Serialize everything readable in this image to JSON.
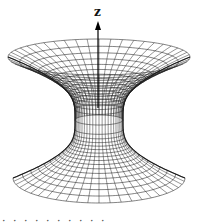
{
  "figure": {
    "type": "embedding-diagram",
    "axis": {
      "label": "z",
      "arrow_top_y": 21,
      "arrow_bottom_y": 108,
      "x": 98
    },
    "surface": {
      "center_x": 99,
      "top_rim": {
        "cy": 57,
        "rx": 91,
        "ry": 18
      },
      "throat": {
        "cy": 120,
        "rx": 24,
        "ry": 5
      },
      "bottom_rim": {
        "cy": 178,
        "rx": 86,
        "ry": 25
      },
      "meridian_count": 48,
      "parallel_count_upper": 14,
      "parallel_count_lower": 16,
      "line_color": "#1a1a1a",
      "background": "#ffffff"
    },
    "caption": {
      "text": "·   ·  ·   ·   ·          ·  ·      ·   ·   ·"
    }
  }
}
